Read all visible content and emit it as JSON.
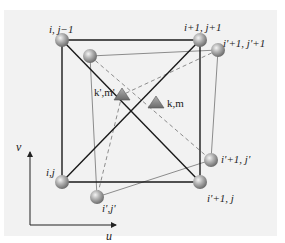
{
  "figure": {
    "colors": {
      "background": "#f2f2f2",
      "outer_edges": "#1a1a1a",
      "inner_edges": "#8c8c8c",
      "dashed": "#8c8c8c",
      "sphere": "#a8a8a8",
      "triangle": "#8a8a8a"
    },
    "nodes": {
      "outer_top_left": "i, j−1",
      "outer_top_right": "i+1, j+1",
      "outer_bottom_left": "i,j",
      "outer_bottom_right": "i'+1, j",
      "inner_top_right": "i'+1, j'+1",
      "inner_bottom_right": "i'+1, j'",
      "inner_bottom_left": "i',j'"
    },
    "markers": {
      "k_prime_m_prime": "k',m'",
      "k_m": "k,m"
    },
    "axes": {
      "x_label": "u",
      "y_label": "v"
    }
  }
}
